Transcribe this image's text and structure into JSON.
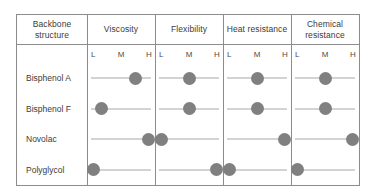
{
  "table": {
    "row_header_label": "Backbone structure",
    "row_header_line1": "Backbone",
    "row_header_line2": "structure",
    "columns": [
      {
        "id": "viscosity",
        "label": "Viscosity",
        "line1": "Viscosity",
        "line2": ""
      },
      {
        "id": "flexibility",
        "label": "Flexibility",
        "line1": "Flexibility",
        "line2": ""
      },
      {
        "id": "heat-resistance",
        "label": "Heat resistance",
        "line1": "Heat resistance",
        "line2": ""
      },
      {
        "id": "chemical-resistance",
        "label": "Chemical resistance",
        "line1": "Chemical",
        "line2": "resistance"
      }
    ],
    "scale_ticks": [
      "L",
      "M",
      "H"
    ],
    "rows": [
      {
        "id": "bisphenol-a",
        "label": "Bisphenol A"
      },
      {
        "id": "bisphenol-f",
        "label": "Bisphenol F"
      },
      {
        "id": "novolac",
        "label": "Novolac"
      },
      {
        "id": "polyglycol",
        "label": "Polyglycol"
      }
    ]
  },
  "colors": {
    "marker": "#808080",
    "axis_line": "#a8a8a8",
    "border": "#8c8c8c",
    "text": "#3b3b3b",
    "background": "#ffffff"
  },
  "chart_data": {
    "type": "scatter",
    "title": "",
    "xlabel": "",
    "ylabel": "Backbone structure",
    "grid": false,
    "legend": "none",
    "scale": {
      "ticks": [
        "L",
        "M",
        "H"
      ],
      "tick_positions_pct": [
        9,
        50,
        91
      ],
      "xlim": [
        0,
        100
      ]
    },
    "categories": [
      "Bisphenol A",
      "Bisphenol F",
      "Novolac",
      "Polyglycol"
    ],
    "panels": [
      {
        "name": "Viscosity",
        "values": [
          "M-H",
          "L-M",
          "H",
          "L"
        ],
        "positions_pct": [
          72,
          22,
          91,
          9
        ]
      },
      {
        "name": "Flexibility",
        "values": [
          "M",
          "M",
          "L",
          "H"
        ],
        "positions_pct": [
          50,
          50,
          9,
          91
        ]
      },
      {
        "name": "Heat resistance",
        "values": [
          "M",
          "M",
          "H",
          "L"
        ],
        "positions_pct": [
          50,
          50,
          91,
          9
        ]
      },
      {
        "name": "Chemical resistance",
        "values": [
          "M",
          "M",
          "H",
          "L"
        ],
        "positions_pct": [
          50,
          50,
          91,
          9
        ]
      }
    ]
  }
}
